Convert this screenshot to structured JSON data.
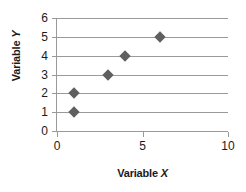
{
  "chart_data": {
    "type": "scatter",
    "title": "",
    "xlabel": "Variable X",
    "ylabel": "Variable Y",
    "xlim": [
      0,
      10
    ],
    "ylim": [
      0,
      6
    ],
    "x_ticks": [
      "0",
      "5",
      "10"
    ],
    "x_tick_values": [
      0,
      5,
      10
    ],
    "y_ticks": [
      "0",
      "1",
      "2",
      "3",
      "4",
      "5",
      "6"
    ],
    "y_tick_values": [
      0,
      1,
      2,
      3,
      4,
      5,
      6
    ],
    "grid": "horizontal",
    "legend": "none",
    "marker": "diamond",
    "marker_color": "#5f5f5f",
    "axis_color": "#9a9a9a",
    "points": [
      {
        "x": 1,
        "y": 1
      },
      {
        "x": 1,
        "y": 2
      },
      {
        "x": 3,
        "y": 3
      },
      {
        "x": 4,
        "y": 4
      },
      {
        "x": 6,
        "y": 5
      }
    ]
  },
  "axis_titles": {
    "x_prefix": "Variable ",
    "x_var": "X",
    "y_prefix": "Variable ",
    "y_var": "Y"
  }
}
